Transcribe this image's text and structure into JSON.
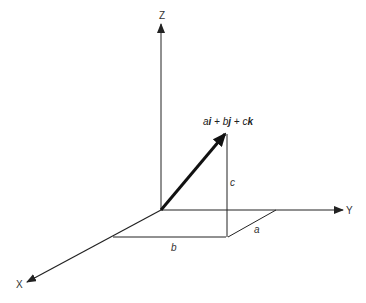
{
  "diagram": {
    "axes": {
      "z_label": "Z",
      "y_label": "Y",
      "x_label": "X"
    },
    "vector_label": "ai + bj + ck",
    "component_labels": {
      "a": "a",
      "b": "b",
      "c": "c"
    },
    "colors": {
      "line": "#222222",
      "text": "#333333",
      "background": "#ffffff"
    }
  }
}
